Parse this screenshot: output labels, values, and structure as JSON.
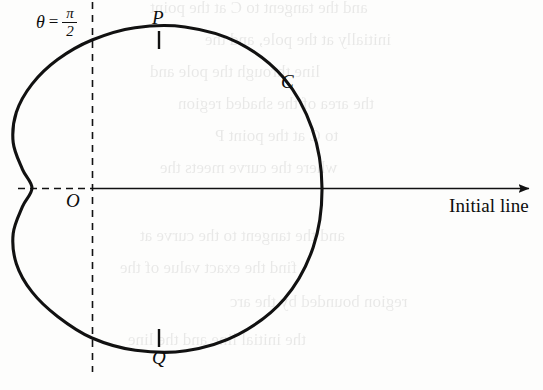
{
  "figure": {
    "kind": "polar-curve-diagram",
    "background_color": "#fdfdfc",
    "ink_color": "#111111",
    "labels": {
      "theta_symbol": "θ",
      "equals": "=",
      "pi_numerator": "π",
      "two_denominator": "2",
      "point_P": "P",
      "point_Q": "Q",
      "pole_O": "O",
      "curve_C": "C",
      "initial_line": "Initial line"
    },
    "bleed_through_text": [
      "and the tangent to C at the point",
      "initially at the pole, and the",
      "line through the pole and",
      "the area of the shaded region",
      "to C at the point P",
      "where the curve meets the",
      "and the tangent to the curve at",
      "find the exact value of the",
      "region bounded by the arc",
      "the initial line and the line"
    ]
  },
  "chart_data": {
    "type": "line",
    "title": "",
    "xlabel": "Initial line",
    "ylabel": "",
    "grid": false,
    "legend": "none",
    "coordinate_system": "polar",
    "polar_equation": "r = a(1 + cos θ) style cardioid with inward dimple at θ = π",
    "pole_pixel": [
      92,
      188
    ],
    "axis_ranges": {
      "theta": [
        0,
        6.283185
      ],
      "r_pixels": [
        25,
        230
      ]
    },
    "annotations": [
      {
        "label": "O",
        "role": "pole",
        "theta": null,
        "r": 0,
        "pixel": [
          92,
          188
        ]
      },
      {
        "label": "P",
        "role": "curve point at θ = π/2",
        "theta": 1.570796,
        "r": 148,
        "pixel": [
          159,
          40
        ]
      },
      {
        "label": "Q",
        "role": "curve point at θ = -π/2",
        "theta": -1.570796,
        "r": 150,
        "pixel": [
          159,
          338
        ]
      },
      {
        "label": "C",
        "role": "curve name",
        "theta": 0.72,
        "r": 215,
        "pixel": [
          288,
          85
        ]
      },
      {
        "label": "θ = π/2",
        "role": "half-line label",
        "theta": 1.570796,
        "r": null,
        "pixel": [
          60,
          22
        ]
      }
    ],
    "series": [
      {
        "name": "C",
        "style": "solid",
        "closed": true,
        "points_polar_deg": [
          {
            "theta": 0,
            "r": 230
          },
          {
            "theta": 15,
            "r": 228
          },
          {
            "theta": 30,
            "r": 221
          },
          {
            "theta": 45,
            "r": 206
          },
          {
            "theta": 60,
            "r": 186
          },
          {
            "theta": 75,
            "r": 166
          },
          {
            "theta": 90,
            "r": 148
          },
          {
            "theta": 105,
            "r": 133
          },
          {
            "theta": 120,
            "r": 120
          },
          {
            "theta": 135,
            "r": 107
          },
          {
            "theta": 150,
            "r": 91
          },
          {
            "theta": 165,
            "r": 72
          },
          {
            "theta": 180,
            "r": 60
          },
          {
            "theta": 195,
            "r": 72
          },
          {
            "theta": 210,
            "r": 91
          },
          {
            "theta": 225,
            "r": 107
          },
          {
            "theta": 240,
            "r": 120
          },
          {
            "theta": 255,
            "r": 133
          },
          {
            "theta": 270,
            "r": 150
          },
          {
            "theta": 285,
            "r": 168
          },
          {
            "theta": 300,
            "r": 188
          },
          {
            "theta": 315,
            "r": 207
          },
          {
            "theta": 330,
            "r": 222
          },
          {
            "theta": 345,
            "r": 229
          },
          {
            "theta": 360,
            "r": 230
          }
        ]
      }
    ],
    "reference_lines": [
      {
        "name": "initial-line",
        "style": "solid",
        "from_pixel": [
          92,
          188
        ],
        "to_pixel": [
          535,
          188
        ],
        "arrow_end": true
      },
      {
        "name": "dashed-polar-axis",
        "style": "dashed",
        "from_pixel": [
          18,
          188
        ],
        "to_pixel": [
          92,
          188
        ],
        "arrow_end": false
      },
      {
        "name": "theta-half-pi-line",
        "style": "dashed",
        "from_pixel": [
          92,
          2
        ],
        "to_pixel": [
          92,
          372
        ],
        "arrow_end": false
      }
    ],
    "tick_marks": [
      {
        "for": "P",
        "pixel": [
          159,
          40
        ],
        "orientation": "vertical",
        "length": 17
      },
      {
        "for": "Q",
        "pixel": [
          159,
          338
        ],
        "orientation": "vertical",
        "length": 17
      }
    ]
  }
}
